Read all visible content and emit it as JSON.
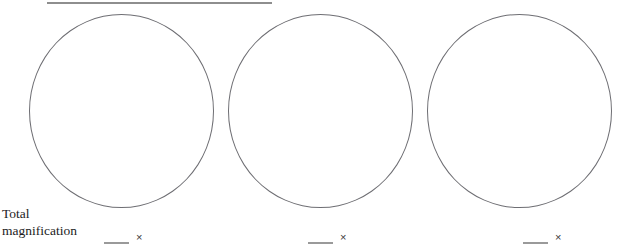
{
  "worksheet": {
    "label": {
      "line1": "Total",
      "line2": "magnification"
    },
    "answers": [
      {
        "blank_value": "",
        "unit_symbol": "×"
      },
      {
        "blank_value": "",
        "unit_symbol": "×"
      },
      {
        "blank_value": "",
        "unit_symbol": "×"
      }
    ],
    "fields_of_view": [
      {
        "name": "field-of-view-1",
        "content": ""
      },
      {
        "name": "field-of-view-2",
        "content": ""
      },
      {
        "name": "field-of-view-3",
        "content": ""
      }
    ],
    "colors": {
      "background": "#ffffff",
      "circle_outline": "#6e6e73",
      "rule": "#8e8e8e",
      "blank_rule": "#9a9a9a",
      "text": "#1c1c1c"
    }
  }
}
